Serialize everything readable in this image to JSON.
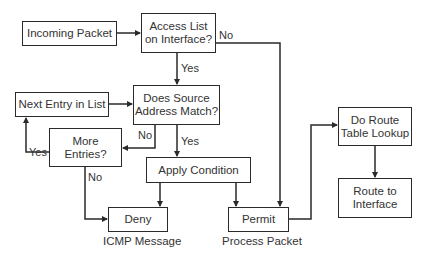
{
  "diagram": {
    "type": "flowchart",
    "nodes": {
      "incoming_packet": "Incoming Packet",
      "access_list": "Access List\non Interface?",
      "next_entry": "Next Entry in List",
      "does_source": "Does Source\nAddress Match?",
      "more_entries": "More\nEntries?",
      "apply_condition": "Apply Condition",
      "deny": "Deny",
      "permit": "Permit",
      "do_route": "Do Route\nTable Lookup",
      "route_to_interface": "Route to\nInterface"
    },
    "captions": {
      "deny": "ICMP Message",
      "permit": "Process Packet"
    },
    "edge_labels": {
      "access_list_no": "No",
      "access_list_yes": "Yes",
      "does_source_no": "No",
      "does_source_yes": "Yes",
      "more_entries_yes": "Yes",
      "more_entries_no": "No"
    },
    "edges": [
      {
        "from": "Incoming Packet",
        "to": "Access List on Interface?"
      },
      {
        "from": "Access List on Interface?",
        "to": "Does Source Address Match?",
        "label": "Yes"
      },
      {
        "from": "Access List on Interface?",
        "to": "Permit",
        "label": "No"
      },
      {
        "from": "Next Entry in List",
        "to": "Does Source Address Match?"
      },
      {
        "from": "Does Source Address Match?",
        "to": "More Entries?",
        "label": "No"
      },
      {
        "from": "Does Source Address Match?",
        "to": "Apply Condition",
        "label": "Yes"
      },
      {
        "from": "More Entries?",
        "to": "Next Entry in List",
        "label": "Yes"
      },
      {
        "from": "More Entries?",
        "to": "Deny",
        "label": "No"
      },
      {
        "from": "Apply Condition",
        "to": "Deny"
      },
      {
        "from": "Apply Condition",
        "to": "Permit"
      },
      {
        "from": "Permit",
        "to": "Do Route Table Lookup"
      },
      {
        "from": "Do Route Table Lookup",
        "to": "Route to Interface"
      }
    ],
    "colors": {
      "line": "#2a2a2a",
      "text": "#333333",
      "background": "#ffffff"
    }
  }
}
